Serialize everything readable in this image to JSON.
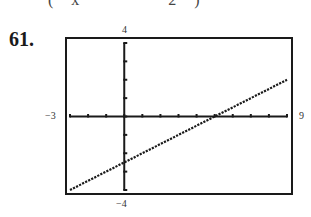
{
  "header": {
    "cutoff_text": "(x − 2)",
    "problem_number": "61."
  },
  "window": {
    "xmin_label": "−3",
    "xmax_label": "9",
    "ymax_label": "4",
    "ymin_label": "−4"
  },
  "chart_data": {
    "type": "line",
    "title": "",
    "xlabel": "",
    "ylabel": "",
    "xlim": [
      -3,
      9
    ],
    "ylim": [
      -4,
      4
    ],
    "xscale": 1,
    "yscale": 1,
    "grid": false,
    "style": "graphing calculator window, dotted line",
    "series": [
      {
        "name": "y = 0.5x - 2.5",
        "x": [
          -3,
          0,
          5,
          9
        ],
        "y": [
          -4,
          -2.5,
          0,
          2
        ]
      }
    ],
    "annotations": [
      "Window labels: -3, 9 (x); -4, 4 (y)"
    ]
  }
}
